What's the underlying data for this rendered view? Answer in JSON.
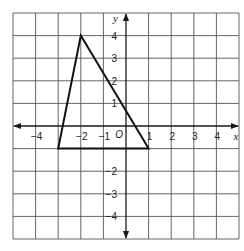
{
  "figure": {
    "axis_labels": {
      "x": "x",
      "y": "y",
      "origin": "O"
    }
  },
  "chart_data": {
    "type": "diagram",
    "title": "",
    "xlabel": "x",
    "ylabel": "y",
    "xlim": [
      -5,
      5
    ],
    "ylim": [
      -5,
      5
    ],
    "grid": true,
    "x_tick_labels": [
      "-4",
      "-2",
      "-1",
      "1",
      "2",
      "3",
      "4"
    ],
    "x_ticks": [
      -4,
      -2,
      -1,
      1,
      2,
      3,
      4
    ],
    "y_tick_labels": [
      "4",
      "3",
      "2",
      "1",
      "-2",
      "-3",
      "-4"
    ],
    "y_ticks": [
      4,
      3,
      2,
      1,
      -2,
      -3,
      -4
    ],
    "origin_label": "O",
    "shapes": [
      {
        "type": "triangle",
        "vertices": [
          [
            -2,
            4
          ],
          [
            -3,
            -1
          ],
          [
            1,
            -1
          ]
        ]
      }
    ]
  },
  "colors": {
    "grid": "#555555",
    "axes": "#1a1a1a",
    "shape": "#111111",
    "background": "#ffffff"
  }
}
